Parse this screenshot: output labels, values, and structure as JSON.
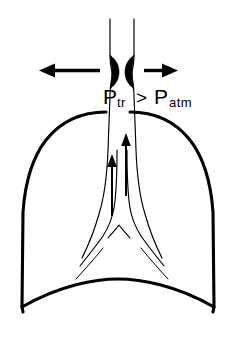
{
  "figure": {
    "background_color": "#ffffff",
    "ink_color": "#000000",
    "width": 236,
    "height": 345
  },
  "annotation": {
    "pressure_label": {
      "p1_symbol": "P",
      "p1_subscript": "tr",
      "relation": ">",
      "p2_symbol": "P",
      "p2_subscript": "atm",
      "full_text": "Ptr > Patm"
    }
  },
  "parts": {
    "lung_outline": "lung-body-outline",
    "diaphragm": "diaphragm-curve",
    "trachea_left_wall": "trachea-left-wall",
    "trachea_right_wall": "trachea-right-wall",
    "carina": "carina-bifurcation",
    "left_bronchus": "left-main-bronchus",
    "right_bronchus": "right-main-bronchus",
    "compression_wedge_left": "airway-compression-wedge-left",
    "compression_wedge_right": "airway-compression-wedge-right",
    "outward_arrow_left": "outward-pressure-arrow-left",
    "outward_arrow_right": "outward-pressure-arrow-right",
    "airflow_arrow_left": "airflow-arrow-left",
    "airflow_arrow_right": "airflow-arrow-right"
  }
}
